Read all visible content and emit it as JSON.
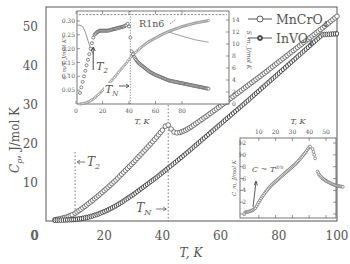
{
  "chart_data": [
    {
      "type": "scatter",
      "title": "",
      "xlabel": "T, K",
      "ylabel": "C_p, J/mol K",
      "xlim": [
        0,
        100
      ],
      "ylim": [
        0,
        55
      ],
      "xticks": [
        0,
        20,
        40,
        60,
        80,
        100
      ],
      "yticks": [
        0,
        10,
        20,
        30,
        40,
        50
      ],
      "grid": false,
      "legend_position": "upper right",
      "legend": [
        "MnCrO4",
        "InVO4"
      ],
      "annotations": [
        {
          "text": "T2",
          "x": 10,
          "style": "dotted vertical line",
          "arrow": "left"
        },
        {
          "text": "TN",
          "x": 42,
          "style": "dotted vertical line",
          "arrow": "right"
        }
      ],
      "series": [
        {
          "name": "MnCrO4",
          "marker": "open-circle",
          "x": [
            3,
            5,
            7,
            9,
            10,
            12,
            14,
            16,
            18,
            20,
            22,
            24,
            26,
            28,
            30,
            32,
            34,
            36,
            38,
            40,
            41,
            42,
            43,
            44,
            45,
            46,
            48,
            50,
            55,
            60,
            65,
            70,
            75,
            80,
            85,
            90,
            95,
            100
          ],
          "y": [
            0.3,
            0.6,
            1.0,
            1.6,
            2.0,
            3.0,
            4.1,
            5.3,
            6.5,
            7.8,
            9.1,
            10.5,
            12.0,
            13.5,
            15.0,
            16.6,
            18.2,
            19.8,
            21.5,
            23.3,
            24.3,
            24.6,
            23.6,
            22.8,
            22.6,
            22.7,
            23.3,
            24.2,
            26.8,
            29.5,
            32.3,
            35.1,
            37.9,
            40.8,
            43.7,
            46.6,
            49.5,
            52.5
          ]
        },
        {
          "name": "InVO4",
          "marker": "half-filled-circle",
          "x": [
            3,
            5,
            8,
            10,
            12,
            14,
            16,
            18,
            20,
            22,
            24,
            26,
            28,
            30,
            32,
            34,
            36,
            38,
            40,
            42,
            45,
            50,
            55,
            60,
            65,
            70,
            75,
            80,
            85,
            90,
            95,
            100
          ],
          "y": [
            0.2,
            0.2,
            0.3,
            0.4,
            0.6,
            0.9,
            1.3,
            1.8,
            2.4,
            3.1,
            3.9,
            4.8,
            5.8,
            6.8,
            7.9,
            9.0,
            10.1,
            11.2,
            12.4,
            13.6,
            15.4,
            18.5,
            21.7,
            24.9,
            28.1,
            31.3,
            34.6,
            37.9,
            41.2,
            44.5,
            47.8,
            48.0
          ]
        }
      ]
    },
    {
      "type": "scatter",
      "title": "inset (upper left)",
      "xlabel": "T, K",
      "ylabel": "C_m/T, J/mol K^2",
      "ylabel_right": "S_m, J/mol K",
      "xlim": [
        0,
        112
      ],
      "ylim": [
        0,
        0.32
      ],
      "ylim_right": [
        0,
        15
      ],
      "xticks": [
        0,
        20,
        40,
        60,
        80
      ],
      "yticks": [
        0.05,
        0.1,
        0.15,
        0.2,
        0.25,
        0.3
      ],
      "yticks_right": [
        0,
        2,
        4,
        6,
        8,
        10,
        12,
        14
      ],
      "annotations": [
        {
          "text": "R ln6",
          "style": "dashed horizontal line",
          "y_right": 14.9
        },
        {
          "text": "T2",
          "x": 13,
          "arrow": "up"
        },
        {
          "text": "TN",
          "x": 41,
          "style": "dotted vertical line",
          "arrow": "right"
        }
      ],
      "series": [
        {
          "name": "C_m/T (MnCrO4)",
          "marker": "open-diamond",
          "axis": "left",
          "x": [
            3,
            4,
            5,
            6,
            7,
            8,
            9,
            10,
            11,
            12,
            13,
            14,
            16,
            18,
            20,
            24,
            28,
            32,
            36,
            38,
            39,
            40,
            41,
            42,
            43,
            44,
            46,
            48,
            52,
            56,
            60,
            65,
            70,
            75,
            80,
            85,
            90,
            95,
            100
          ],
          "y": [
            0.04,
            0.06,
            0.08,
            0.1,
            0.12,
            0.14,
            0.16,
            0.18,
            0.2,
            0.22,
            0.24,
            0.25,
            0.26,
            0.265,
            0.265,
            0.265,
            0.27,
            0.275,
            0.28,
            0.285,
            0.29,
            0.28,
            0.24,
            0.19,
            0.18,
            0.17,
            0.155,
            0.145,
            0.13,
            0.115,
            0.105,
            0.095,
            0.085,
            0.08,
            0.075,
            0.07,
            0.065,
            0.06,
            0.055
          ]
        },
        {
          "name": "S_m (MnCrO4)",
          "marker": "small-circle",
          "axis": "right",
          "x": [
            3,
            6,
            10,
            14,
            18,
            22,
            26,
            30,
            34,
            38,
            42,
            46,
            50,
            55,
            60,
            65,
            70,
            75,
            80,
            85,
            90,
            95,
            100
          ],
          "y": [
            0.0,
            0.1,
            0.4,
            1.0,
            1.8,
            2.7,
            3.7,
            4.7,
            5.8,
            6.8,
            8.0,
            8.8,
            9.6,
            10.4,
            11.0,
            11.6,
            12.1,
            12.5,
            12.9,
            13.2,
            13.5,
            13.7,
            13.9
          ]
        },
        {
          "name": "C_m/T lattice fit",
          "marker": "line",
          "axis": "left",
          "x": [
            1,
            3,
            5,
            7,
            9,
            11,
            13
          ],
          "y": [
            0.285,
            0.285,
            0.28,
            0.26,
            0.23,
            0.2,
            0.18
          ]
        },
        {
          "name": "S_m tail",
          "marker": "line",
          "axis": "right",
          "x": [
            70,
            80,
            90,
            100
          ],
          "y": [
            12.0,
            11.3,
            10.7,
            10.3
          ]
        }
      ]
    },
    {
      "type": "scatter",
      "title": "inset (lower right)",
      "xlabel": "T, K",
      "ylabel": "C_m, J/mol K",
      "xlim": [
        0,
        60
      ],
      "ylim": [
        0,
        13
      ],
      "xticks": [
        10,
        20,
        30,
        40,
        50
      ],
      "yticks": [
        0,
        2,
        4,
        6,
        8,
        10,
        12
      ],
      "annotations": [
        {
          "text": "C ~ T^(d/n)",
          "x": 8,
          "arrow": "up"
        }
      ],
      "series": [
        {
          "name": "C_m (InVO4)",
          "marker": "open-circle",
          "x": [
            2,
            4,
            6,
            8,
            10,
            12,
            14,
            16,
            18,
            20,
            22,
            24,
            26,
            28,
            30,
            32,
            34,
            36,
            38,
            40,
            41,
            42,
            43,
            44,
            45,
            46,
            48,
            50,
            52,
            54,
            56,
            58,
            60
          ],
          "y": [
            0.3,
            0.4,
            0.6,
            1.0,
            2.0,
            2.9,
            3.7,
            4.4,
            5.0,
            5.5,
            6.0,
            6.5,
            7.0,
            7.5,
            8.0,
            8.5,
            9.1,
            9.8,
            10.5,
            11.3,
            11.5,
            11.0,
            10.0,
            8.8,
            7.2,
            6.6,
            6.0,
            5.6,
            5.3,
            5.0,
            4.8,
            4.7,
            4.6
          ]
        }
      ]
    }
  ]
}
